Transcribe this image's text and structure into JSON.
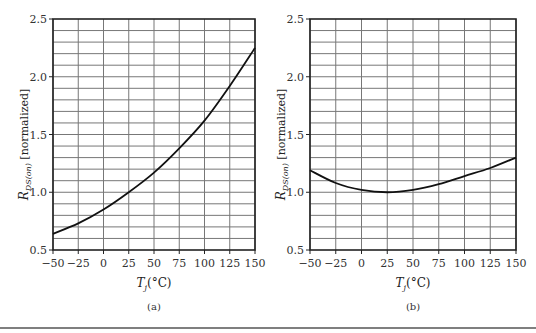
{
  "chart_data": [
    {
      "type": "line",
      "panel_label": "(a)",
      "xlabel": "T_j(°C)",
      "ylabel": "R_DS(on) [normalized]",
      "xlim": [
        -50,
        150
      ],
      "ylim": [
        0.5,
        2.5
      ],
      "x_ticks": [
        "-50",
        "-25",
        "0",
        "25",
        "50",
        "75",
        "100",
        "125",
        "150"
      ],
      "y_ticks": [
        "0.5",
        "1.0",
        "1.5",
        "2.0",
        "2.5"
      ],
      "grid": true,
      "x": [
        -50,
        -25,
        0,
        25,
        50,
        75,
        100,
        125,
        150
      ],
      "series": [
        {
          "name": "R_DS(on)",
          "values": [
            0.64,
            0.73,
            0.85,
            1.0,
            1.17,
            1.38,
            1.62,
            1.92,
            2.25
          ]
        }
      ]
    },
    {
      "type": "line",
      "panel_label": "(b)",
      "xlabel": "T_j(°C)",
      "ylabel": "R_DS(on) [normalized]",
      "xlim": [
        -50,
        150
      ],
      "ylim": [
        0.5,
        2.5
      ],
      "x_ticks": [
        "-50",
        "-25",
        "0",
        "25",
        "50",
        "75",
        "100",
        "125",
        "150"
      ],
      "y_ticks": [
        "0.5",
        "1.0",
        "1.5",
        "2.0",
        "2.5"
      ],
      "grid": true,
      "x": [
        -50,
        -25,
        0,
        25,
        50,
        75,
        100,
        125,
        150
      ],
      "series": [
        {
          "name": "R_DS(on)",
          "values": [
            1.19,
            1.08,
            1.02,
            1.0,
            1.02,
            1.07,
            1.14,
            1.21,
            1.3
          ]
        }
      ]
    }
  ],
  "labels": {
    "a": {
      "xlabel_main": "T",
      "xlabel_sub": "j",
      "xlabel_unit": "(°C)",
      "ylabel_main": "R",
      "ylabel_sub": "DS(on)",
      "ylabel_rest": " [normalized]",
      "caption": "(a)"
    },
    "b": {
      "xlabel_main": "T",
      "xlabel_sub": "j",
      "xlabel_unit": "(°C)",
      "ylabel_main": "R",
      "ylabel_sub": "DS(on)",
      "ylabel_rest": " [normalized]",
      "caption": "(b)"
    }
  }
}
